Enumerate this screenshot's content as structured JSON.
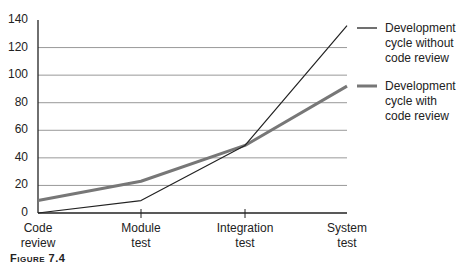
{
  "chart_data": {
    "type": "line",
    "title": "",
    "xlabel": "",
    "ylabel": "",
    "categories": [
      "Code review",
      "Module test",
      "Integration test",
      "System test"
    ],
    "category_lines": [
      [
        "Code",
        "review"
      ],
      [
        "Module",
        "test"
      ],
      [
        "Integration",
        "test"
      ],
      [
        "System",
        "test"
      ]
    ],
    "series": [
      {
        "name": "Development cycle without code review",
        "values": [
          0,
          9,
          49,
          136
        ],
        "color": "#222222",
        "width": 1.2
      },
      {
        "name": "Development cycle with code review",
        "values": [
          9,
          23,
          49,
          92
        ],
        "color": "#777777",
        "width": 3
      }
    ],
    "yticks": [
      "0",
      "20",
      "40",
      "60",
      "80",
      "100",
      "120",
      "140"
    ],
    "ylim": [
      0,
      140
    ],
    "grid": true,
    "legend_position": "right"
  },
  "legend": {
    "without_lines": [
      "Development",
      "cycle without",
      "code review"
    ],
    "with_lines": [
      "Development",
      "cycle with",
      "code review"
    ]
  },
  "caption": "Figure 7.4"
}
